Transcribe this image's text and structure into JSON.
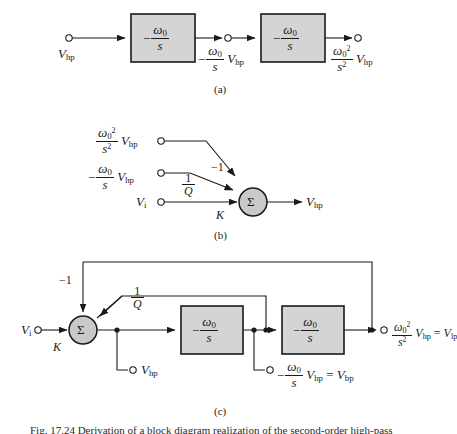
{
  "figure": {
    "caption": "Fig. 17.24  Derivation of a block diagram realization of the second-order high-pass",
    "panels": [
      {
        "id": "a",
        "letter": "(a)"
      },
      {
        "id": "b",
        "letter": "(b)"
      },
      {
        "id": "c",
        "letter": "(c)"
      }
    ]
  },
  "symbols": {
    "omega0": "ω",
    "sigma": "Σ",
    "zero_sub": "0",
    "two_sup": "2"
  },
  "panel_a": {
    "input_label": "V",
    "input_sub": "hp",
    "block1": {
      "sign": "−",
      "num": "ω",
      "num_sub": "0",
      "den": "s"
    },
    "block2": {
      "sign": "−",
      "num": "ω",
      "num_sub": "0",
      "den": "s"
    },
    "mid_label": {
      "sign": "−",
      "num": "ω",
      "num_sub": "0",
      "den": "s",
      "var": "V",
      "var_sub": "hp"
    },
    "out_label": {
      "num": "ω",
      "num_sub": "0",
      "num_sup": "2",
      "den": "s",
      "den_sup": "2",
      "var": "V",
      "var_sub": "hp"
    }
  },
  "panel_b": {
    "input_top": {
      "num": "ω",
      "num_sub": "0",
      "num_sup": "2",
      "den": "s",
      "den_sup": "2",
      "var": "V",
      "var_sub": "hp"
    },
    "input_mid": {
      "sign": "−",
      "num": "ω",
      "num_sub": "0",
      "den": "s",
      "var": "V",
      "var_sub": "hp"
    },
    "input_bot": {
      "var": "V",
      "var_sub": "i"
    },
    "gain_top": "−1",
    "gain_mid_num": "1",
    "gain_mid_den": "Q",
    "gain_bot": "K",
    "summer": "Σ",
    "output": {
      "var": "V",
      "var_sub": "hp"
    }
  },
  "panel_c": {
    "input": {
      "var": "V",
      "var_sub": "i"
    },
    "gain_k": "K",
    "gain_neg1": "−1",
    "gain_q_num": "1",
    "gain_q_den": "Q",
    "summer": "Σ",
    "block1": {
      "sign": "−",
      "num": "ω",
      "num_sub": "0",
      "den": "s"
    },
    "block2": {
      "sign": "−",
      "num": "ω",
      "num_sub": "0",
      "den": "s"
    },
    "tap_hp": {
      "var": "V",
      "var_sub": "hp"
    },
    "tap_bp": {
      "sign": "−",
      "num": "ω",
      "num_sub": "0",
      "den": "s",
      "var": "V",
      "var_sub": "hp",
      "eq": "=",
      "res": "V",
      "res_sub": "bp"
    },
    "out_lp": {
      "num": "ω",
      "num_sub": "0",
      "num_sup": "2",
      "den": "s",
      "den_sup": "2",
      "var": "V",
      "var_sub": "hp",
      "eq": "=",
      "res": "V",
      "res_sub": "lp"
    }
  },
  "style": {
    "block_fill": "#d4d4d4",
    "line_color": "#1a1a1a",
    "summer_fill": "#c9c9c9"
  }
}
